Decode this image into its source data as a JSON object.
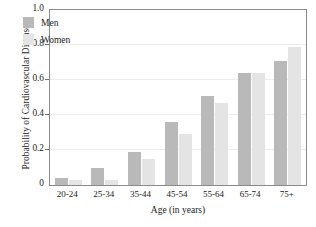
{
  "chart_data": {
    "type": "bar",
    "title": "",
    "xlabel": "Age (in years)",
    "ylabel": "Probability of Cardiovascular Disease",
    "categories": [
      "20-24",
      "25-34",
      "35-44",
      "45-54",
      "55-64",
      "65-74",
      "75+"
    ],
    "series": [
      {
        "name": "Men",
        "color": "#b9b9b9",
        "values": [
          0.04,
          0.1,
          0.19,
          0.36,
          0.51,
          0.64,
          0.71
        ]
      },
      {
        "name": "Women",
        "color": "#e4e4e4",
        "values": [
          0.03,
          0.03,
          0.15,
          0.29,
          0.47,
          0.64,
          0.79
        ]
      }
    ],
    "ylim": [
      0,
      1.0
    ],
    "yticks": [
      "0",
      "0.2",
      "0.4",
      "0.6",
      "0.8",
      "1.0"
    ],
    "ytick_values": [
      0,
      0.2,
      0.4,
      0.6,
      0.8,
      1.0
    ],
    "grid": true,
    "grid_axis": "y",
    "legend_position": "upper-left-inside"
  },
  "legend": {
    "items": [
      {
        "label": "Men"
      },
      {
        "label": "Women"
      }
    ]
  },
  "axes": {
    "y_title": "Probability of Cardiovascular Disease",
    "x_title": "Age (in years)"
  }
}
